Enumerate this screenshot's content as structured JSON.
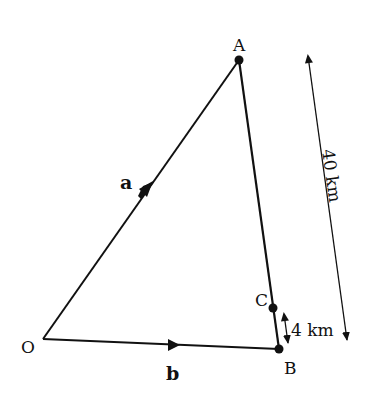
{
  "diagram": {
    "type": "vector-triangle",
    "colors": {
      "line": "#111111",
      "background": "#ffffff"
    },
    "points": {
      "O": {
        "label": "O",
        "x": 43,
        "y": 339
      },
      "A": {
        "label": "A",
        "x": 239,
        "y": 60
      },
      "B": {
        "label": "B",
        "x": 279,
        "y": 349
      },
      "C": {
        "label": "C",
        "x": 273,
        "y": 308
      }
    },
    "vectors": {
      "a": {
        "label": "a",
        "from": "O",
        "to": "A"
      },
      "b": {
        "label": "b",
        "from": "O",
        "to": "B"
      }
    },
    "segments": [
      {
        "from": "A",
        "to": "B"
      }
    ],
    "dimensions": {
      "AB": {
        "label": "40 km",
        "orientation": "rotated-along-line"
      },
      "CB": {
        "label": "4 km"
      }
    }
  }
}
